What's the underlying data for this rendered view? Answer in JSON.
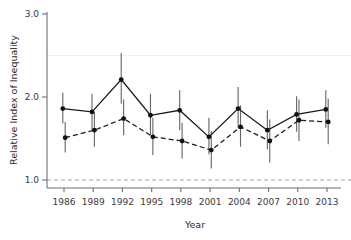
{
  "chart_data": {
    "type": "line",
    "title": "",
    "xlabel": "Year",
    "ylabel": "Relative Index of Inequality",
    "categories": [
      1986,
      1989,
      1992,
      1995,
      1998,
      2001,
      2004,
      2007,
      2010,
      2013
    ],
    "xtick_labels": [
      "1986",
      "1989",
      "1992",
      "1995",
      "1998",
      "2001",
      "2004",
      "2007",
      "2010",
      "2013"
    ],
    "ytick_labels": [
      "1.0",
      "2.0",
      "3.0"
    ],
    "yticks": [
      1.0,
      2.0,
      3.0
    ],
    "ylim": [
      0.92,
      3.05
    ],
    "xlim": [
      1984.6,
      2014.6
    ],
    "grid": false,
    "legend": "none",
    "reference_line": {
      "y": 1.0,
      "style": "dashed",
      "color": "#9a9a9a"
    },
    "series": [
      {
        "name": "series-solid",
        "line_style": "solid",
        "marker": "filled-circle",
        "color": "#111111",
        "values": [
          1.86,
          1.82,
          2.21,
          1.78,
          1.84,
          1.52,
          1.86,
          1.6,
          1.79,
          1.85
        ],
        "err_low": [
          1.68,
          1.6,
          1.92,
          1.54,
          1.6,
          1.31,
          1.62,
          1.37,
          1.58,
          1.63
        ],
        "err_high": [
          2.05,
          2.04,
          2.53,
          2.04,
          2.08,
          1.75,
          2.12,
          1.84,
          2.01,
          2.08
        ]
      },
      {
        "name": "series-dashed",
        "line_style": "dashed",
        "marker": "filled-circle",
        "color": "#111111",
        "values": [
          1.51,
          1.6,
          1.74,
          1.52,
          1.47,
          1.36,
          1.64,
          1.47,
          1.72,
          1.7
        ],
        "err_low": [
          1.33,
          1.4,
          1.54,
          1.3,
          1.26,
          1.14,
          1.4,
          1.21,
          1.47,
          1.43
        ],
        "err_high": [
          1.7,
          1.82,
          1.97,
          1.75,
          1.69,
          1.59,
          1.9,
          1.73,
          1.97,
          1.98
        ]
      }
    ]
  },
  "axes": {
    "y_title": "Relative Index of Inequality",
    "x_title": "Year"
  }
}
